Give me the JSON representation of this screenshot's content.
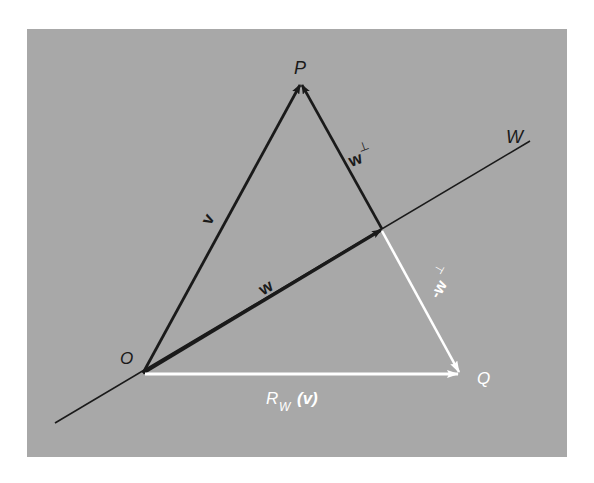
{
  "figure": {
    "background_color": "#ffffff",
    "panel_color": "#a8a8a8",
    "panel": {
      "x": 27,
      "y": 29,
      "width": 540,
      "height": 428
    }
  },
  "points": {
    "O": {
      "label": "O",
      "x": 143,
      "y": 373
    },
    "P": {
      "label": "P",
      "x": 301,
      "y": 83
    },
    "foot": {
      "label": "",
      "x": 382,
      "y": 229
    },
    "Q": {
      "label": "Q",
      "x": 460,
      "y": 374
    }
  },
  "line_W": {
    "label": "W",
    "x1": 55,
    "y1": 423,
    "x2": 530,
    "y2": 141,
    "color": "#1a1a1a"
  },
  "vectors": {
    "v": {
      "label": "v",
      "color": "#1a1a1a"
    },
    "w": {
      "label": "w",
      "color": "#1a1a1a"
    },
    "w_perp": {
      "label": "w",
      "superscript": "⊥",
      "color": "#1a1a1a"
    },
    "neg_w_perp": {
      "label": "-w",
      "superscript": "⊥",
      "color": "#ffffff"
    },
    "reflection": {
      "label_R": "R",
      "label_sub": "W",
      "label_arg": "(v)",
      "color": "#ffffff"
    }
  },
  "labels": {
    "P": "P",
    "O": "O",
    "Q": "Q",
    "W": "W"
  }
}
